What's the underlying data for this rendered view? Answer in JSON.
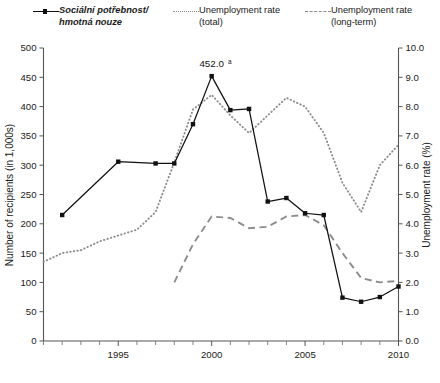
{
  "legend": {
    "items": [
      {
        "label": "Sociální potřebnost/\nhmotná nouze",
        "style": "solid-marker",
        "italic": true,
        "color": "#111111"
      },
      {
        "label": "Unemployment rate\n(total)",
        "style": "dotted",
        "italic": false,
        "color": "#8d8d8d"
      },
      {
        "label": "Unemployment rate\n(long-term)",
        "style": "dashed",
        "italic": false,
        "color": "#8d8d8d"
      }
    ]
  },
  "annotation": {
    "value": "452.0",
    "superscript": "a"
  },
  "chart_data": {
    "type": "line",
    "title": "",
    "xlabel": "",
    "ylabel": "Number of recipients (in 1,000s)",
    "y2label": "Unemployment rate (%)",
    "xlim": [
      1991,
      2010
    ],
    "ylim": [
      0,
      500
    ],
    "y2lim": [
      0.0,
      10.0
    ],
    "yticks": [
      0,
      50,
      100,
      150,
      200,
      250,
      300,
      350,
      400,
      450,
      500
    ],
    "ytick_labels": [
      "0",
      "50",
      "100",
      "150",
      "200",
      "250",
      "300",
      "350",
      "400",
      "450",
      "500"
    ],
    "y2ticks": [
      0.0,
      1.0,
      2.0,
      3.0,
      4.0,
      5.0,
      6.0,
      7.0,
      8.0,
      9.0,
      10.0
    ],
    "y2tick_labels": [
      "0.0",
      "1.0",
      "2.0",
      "3.0",
      "4.0",
      "5.0",
      "6.0",
      "7.0",
      "8.0",
      "9.0",
      "10.0"
    ],
    "xticks": [
      1991,
      1992,
      1993,
      1994,
      1995,
      1996,
      1997,
      1998,
      1999,
      2000,
      2001,
      2002,
      2003,
      2004,
      2005,
      2006,
      2007,
      2008,
      2009,
      2010
    ],
    "xtick_labels_shown": [
      "1995",
      "2000",
      "2005",
      "2010"
    ],
    "xtick_labels_positions": [
      1995,
      2000,
      2005,
      2010
    ],
    "grid": false,
    "legend_position": "above-plot",
    "series": [
      {
        "name": "Sociální potřebnost/hmotná nouze",
        "axis": "left",
        "style": "solid-marker",
        "x": [
          1992,
          1995,
          1997,
          1998,
          1999,
          2000,
          2001,
          2002,
          2003,
          2004,
          2005,
          2006,
          2007,
          2008,
          2009,
          2010
        ],
        "values": [
          215,
          306,
          303,
          303,
          370,
          452,
          394,
          396,
          238,
          244,
          218,
          215,
          74,
          67,
          75,
          93
        ]
      },
      {
        "name": "Unemployment rate (total)",
        "axis": "right",
        "style": "dotted",
        "x": [
          1991,
          1992,
          1993,
          1994,
          1995,
          1996,
          1997,
          1998,
          1999,
          2000,
          2001,
          2002,
          2003,
          2004,
          2005,
          2006,
          2007,
          2008,
          2009,
          2010
        ],
        "values": [
          2.7,
          3.0,
          3.1,
          3.4,
          3.6,
          3.8,
          4.4,
          6.1,
          7.9,
          8.4,
          7.7,
          7.1,
          7.7,
          8.3,
          8.0,
          7.1,
          5.4,
          4.4,
          6.0,
          6.7
        ]
      },
      {
        "name": "Unemployment rate (long-term)",
        "axis": "right",
        "style": "dashed",
        "x": [
          1998,
          1999,
          2000,
          2001,
          2002,
          2003,
          2004,
          2005,
          2006,
          2007,
          2008,
          2009,
          2010
        ],
        "values": [
          2.0,
          3.3,
          4.25,
          4.2,
          3.85,
          3.9,
          4.25,
          4.3,
          3.95,
          3.0,
          2.15,
          2.0,
          2.05
        ]
      }
    ]
  }
}
